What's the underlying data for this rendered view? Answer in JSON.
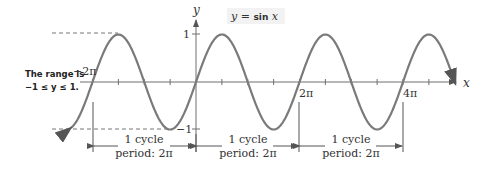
{
  "figure": {
    "title": "y = sin x",
    "equation_prefix": "y = ",
    "equation_func": "sin",
    "equation_var": "x",
    "axis_labels": {
      "x": "x",
      "y": "y"
    },
    "y_ticks": [
      {
        "label": "1",
        "value": 1
      },
      {
        "label": "−1",
        "value": -1
      }
    ],
    "x_tick_labels": [
      {
        "label": "−2π",
        "value": -6.2832
      },
      {
        "label": "2π",
        "value": 6.2832
      },
      {
        "label": "4π",
        "value": 12.5664
      }
    ],
    "range_note": {
      "line1": "The range is",
      "line2": "−1 ≤ y ≤ 1."
    },
    "cycles": [
      {
        "label": "1 cycle",
        "period": "period: 2π"
      },
      {
        "label": "1 cycle",
        "period": "period: 2π"
      },
      {
        "label": "1 cycle",
        "period": "period: 2π"
      }
    ],
    "colors": {
      "curve": "#7a7a7a",
      "axis": "#6e6e6e",
      "text": "#333333",
      "label_bg": "#f2f2f2"
    }
  },
  "chart_data": {
    "type": "line",
    "title": "y = sin x",
    "xlabel": "x",
    "ylabel": "y",
    "function": "sin(x)",
    "x_range": [
      -7.6,
      15.8
    ],
    "ylim": [
      -1,
      1
    ],
    "period": "2π",
    "x_tick_step": "π/2",
    "annotations": [
      "The range is −1 ≤ y ≤ 1.",
      "1 cycle period: 2π (×3)"
    ]
  }
}
